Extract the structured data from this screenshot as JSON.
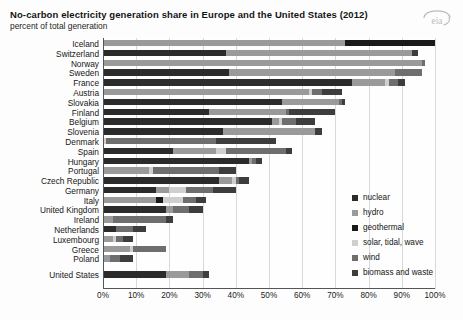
{
  "header": {
    "title": "No-carbon electricity generation share in Europe and the United States (2012)",
    "subtitle": "percent of total generation",
    "logo_alt": "eia"
  },
  "legend": {
    "position": "right",
    "items": [
      {
        "label": "nuclear",
        "color": "#2b2b2b"
      },
      {
        "label": "hydro",
        "color": "#9a9a9a"
      },
      {
        "label": "geothermal",
        "color": "#1a1a1a"
      },
      {
        "label": "solar, tidal, wave",
        "color": "#cfcfcf"
      },
      {
        "label": "wind",
        "color": "#6e6e6e"
      },
      {
        "label": "biomass and waste",
        "color": "#3d3d3d"
      }
    ]
  },
  "chart_data": {
    "type": "bar",
    "orientation": "horizontal",
    "stacked": true,
    "title": "No-carbon electricity generation share in Europe and the United States (2012)",
    "subtitle": "percent of total generation",
    "xlabel": "",
    "ylabel": "",
    "xlim": [
      0,
      100
    ],
    "xticks": [
      "0%",
      "10%",
      "20%",
      "30%",
      "40%",
      "50%",
      "60%",
      "70%",
      "80%",
      "90%",
      "100%"
    ],
    "xtick_values": [
      0,
      10,
      20,
      30,
      40,
      50,
      60,
      70,
      80,
      90,
      100
    ],
    "grid": true,
    "series_names": [
      "nuclear",
      "hydro",
      "geothermal",
      "solar, tidal, wave",
      "wind",
      "biomass and waste"
    ],
    "series_colors": [
      "#2b2b2b",
      "#9a9a9a",
      "#1a1a1a",
      "#cfcfcf",
      "#6e6e6e",
      "#3d3d3d"
    ],
    "categories": [
      "Iceland",
      "Switzerland",
      "Norway",
      "Sweden",
      "France",
      "Austria",
      "Slovakia",
      "Finland",
      "Belgium",
      "Slovenia",
      "Denmark",
      "Spain",
      "Hungary",
      "Portugal",
      "Czech Republic",
      "Germany",
      "Italy",
      "United Kingdom",
      "Ireland",
      "Netherlands",
      "Luxembourg",
      "Greece",
      "Poland",
      "United States"
    ],
    "separator_before": [
      "United States"
    ],
    "series": [
      {
        "name": "nuclear",
        "values": [
          0,
          37,
          0,
          38,
          75,
          0,
          54,
          32,
          51,
          36,
          0,
          21,
          44,
          0,
          35,
          16,
          0,
          19,
          0,
          4,
          0,
          0,
          0,
          19
        ]
      },
      {
        "name": "hydro",
        "values": [
          73,
          56,
          96,
          50,
          10,
          62,
          17,
          23,
          2,
          28,
          0,
          13,
          1,
          14,
          4,
          4,
          16,
          2,
          3,
          0,
          3,
          8,
          2,
          7
        ]
      },
      {
        "name": "geothermal",
        "values": [
          27,
          0,
          0,
          0,
          0,
          0,
          0,
          0,
          0,
          0,
          0,
          0,
          0,
          0,
          0,
          0,
          2,
          0,
          0,
          0,
          0,
          0,
          0,
          0
        ]
      },
      {
        "name": "solar, tidal, wave",
        "values": [
          0,
          0,
          0,
          0,
          1,
          1,
          0,
          0,
          1,
          0,
          1,
          3,
          0,
          1,
          1,
          5,
          6,
          0,
          0,
          0,
          1,
          1,
          0,
          0
        ]
      },
      {
        "name": "wind",
        "values": [
          0,
          0,
          1,
          8,
          3,
          3,
          1,
          1,
          4,
          0,
          33,
          18,
          1,
          20,
          1,
          8,
          4,
          5,
          16,
          5,
          2,
          10,
          3,
          4
        ]
      },
      {
        "name": "biomass and waste",
        "values": [
          0,
          2,
          0,
          0,
          2,
          6,
          1,
          14,
          6,
          2,
          18,
          2,
          2,
          5,
          3,
          7,
          3,
          4,
          2,
          4,
          3,
          0,
          4,
          2
        ]
      }
    ]
  }
}
